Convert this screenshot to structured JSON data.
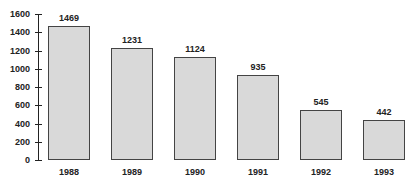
{
  "chart_data": {
    "type": "bar",
    "title": "",
    "xlabel": "",
    "ylabel": "",
    "categories": [
      "1988",
      "1989",
      "1990",
      "1991",
      "1992",
      "1993"
    ],
    "values": [
      1469,
      1231,
      1124,
      935,
      545,
      442
    ],
    "ylim": [
      0,
      1600
    ],
    "yticks": [
      "0",
      "200",
      "400",
      "600",
      "800",
      "1000",
      "1200",
      "1400",
      "1600"
    ],
    "grid": false,
    "legend": null,
    "data_labels": true,
    "bar_color": "#d9d9d9",
    "bar_border_color": "#444444"
  }
}
